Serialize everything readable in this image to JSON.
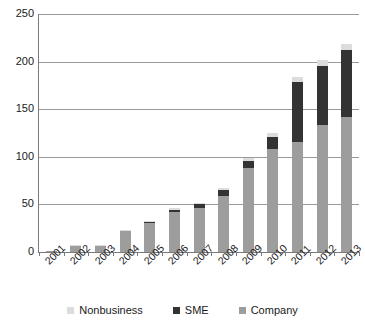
{
  "chart_data": {
    "type": "bar",
    "stacked": true,
    "title": "",
    "subtitle": "",
    "xlabel": "",
    "ylabel": "",
    "categories": [
      "2001",
      "2002",
      "2003",
      "2004",
      "2005",
      "2006",
      "2007",
      "2008",
      "2009",
      "2010",
      "2011",
      "2012",
      "2013"
    ],
    "series": [
      {
        "name": "Company",
        "color": "#9d9d9d",
        "values": [
          1,
          6,
          6,
          22,
          31,
          42,
          46,
          59,
          88,
          108,
          116,
          133,
          142
        ]
      },
      {
        "name": "SME",
        "color": "#333333",
        "values": [
          0,
          0,
          0,
          0,
          1,
          2,
          4,
          6,
          8,
          13,
          63,
          62,
          70
        ]
      },
      {
        "name": "Nonbusiness",
        "color": "#dcdcdc",
        "values": [
          0,
          1,
          1,
          1,
          1,
          2,
          2,
          2,
          3,
          4,
          5,
          7,
          6
        ]
      }
    ],
    "totals": [
      1,
      7,
      7,
      23,
      33,
      46,
      52,
      67,
      99,
      125,
      184,
      202,
      218
    ],
    "ylim": [
      0,
      250
    ],
    "yticks": [
      0,
      50,
      100,
      150,
      200,
      250
    ],
    "ytick_labels": [
      "0",
      "50",
      "100",
      "150",
      "200",
      "250"
    ],
    "grid": true,
    "grid_axis": "y",
    "legend": {
      "position": "bottom",
      "entries": [
        {
          "label": "Nonbusiness",
          "color": "#dcdcdc"
        },
        {
          "label": "SME",
          "color": "#333333"
        },
        {
          "label": "Company",
          "color": "#9d9d9d"
        }
      ]
    },
    "stack_order_bottom_to_top": [
      "Company",
      "SME",
      "Nonbusiness"
    ],
    "xtick_rotation": -45
  }
}
